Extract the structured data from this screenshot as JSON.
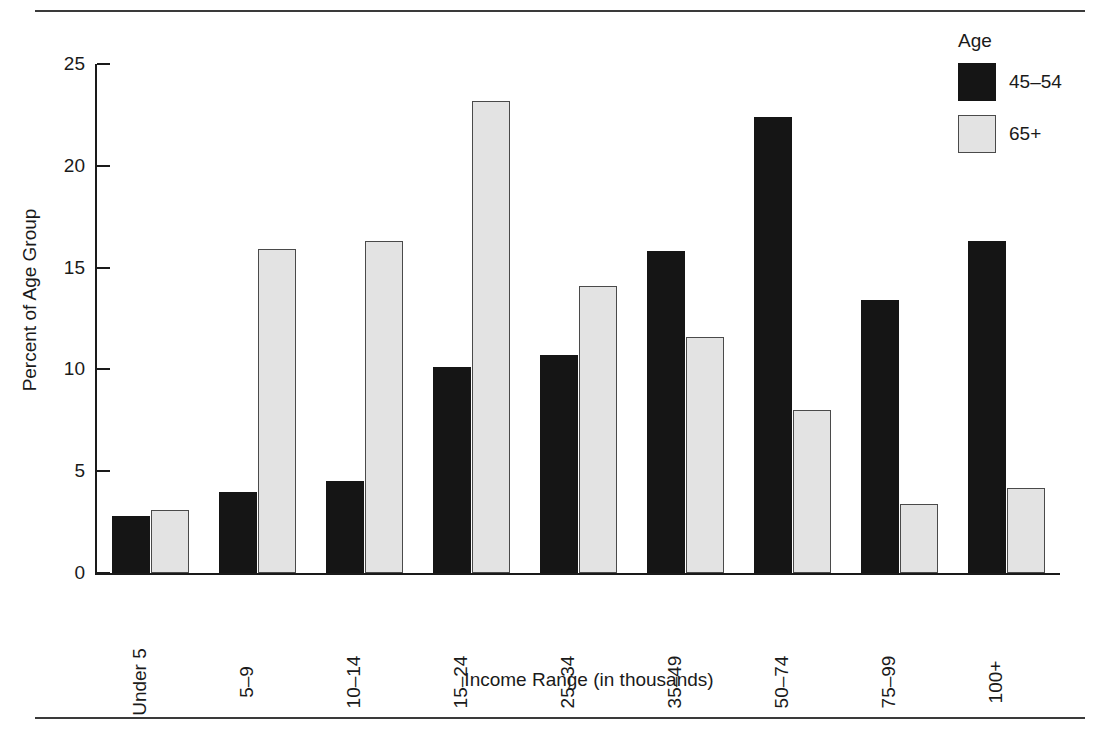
{
  "chart_data": {
    "type": "bar",
    "title": "",
    "subtitle": "",
    "xlabel": "Income Range (in thousands)",
    "ylabel": "Percent of Age Group",
    "categories": [
      "Under 5",
      "5–9",
      "10–14",
      "15–24",
      "25–34",
      "35–49",
      "50–74",
      "75–99",
      "100+"
    ],
    "series": [
      {
        "name": "45–54",
        "color": "#151515",
        "values": [
          2.8,
          4.0,
          4.5,
          10.1,
          10.7,
          15.8,
          22.4,
          13.4,
          16.3
        ]
      },
      {
        "name": "65+",
        "color": "#e3e3e3",
        "values": [
          3.1,
          15.9,
          16.3,
          23.2,
          14.1,
          11.6,
          8.0,
          3.4,
          4.2
        ]
      }
    ],
    "ylim": [
      0,
      25
    ],
    "yticks": [
      0,
      5,
      10,
      15,
      20,
      25
    ],
    "ytick_labels": [
      "0",
      "5",
      "10",
      "15",
      "20",
      "25"
    ],
    "grid": false,
    "legend_position": "top-right",
    "legend_title": "Age"
  },
  "legend": {
    "title": "Age",
    "entries": [
      {
        "label": "45–54",
        "swatch": "dark"
      },
      {
        "label": "65+",
        "swatch": "light"
      }
    ]
  },
  "axes": {
    "y_title": "Percent of Age Group",
    "x_title": "Income Range (in thousands)"
  }
}
